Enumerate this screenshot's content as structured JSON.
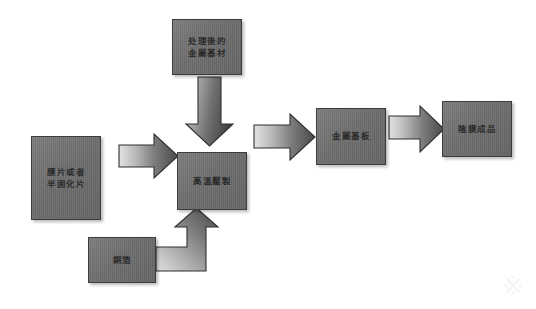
{
  "diagram": {
    "type": "process-flowchart",
    "canvas": {
      "width": 536,
      "height": 309,
      "background": "#ffffff"
    },
    "style": {
      "box_fill": "#707070",
      "box_border": "#3d3d3d",
      "arrow_fill_light": "#d8d8d8",
      "arrow_fill_dark": "#4a4a4a",
      "arrow_border": "#2f2f2f",
      "text_color": "#2b2b2b"
    },
    "nodes": [
      {
        "id": "treated-metal-substrate",
        "label": "处理後的\n金屬基材",
        "x": 172,
        "y": 19,
        "w": 70,
        "h": 56
      },
      {
        "id": "film-or-semi-cured-sheet",
        "label": "膜片或者\n半固化片",
        "x": 31,
        "y": 136,
        "w": 70,
        "h": 84
      },
      {
        "id": "high-temp-pressing",
        "label": "高溫壓製",
        "x": 177,
        "y": 152,
        "w": 70,
        "h": 58
      },
      {
        "id": "copper-foil",
        "label": "銅箔",
        "x": 88,
        "y": 237,
        "w": 68,
        "h": 46
      },
      {
        "id": "metal-base-plate",
        "label": "金屬基板",
        "x": 316,
        "y": 108,
        "w": 70,
        "h": 57
      },
      {
        "id": "finished-film-product",
        "label": "陰膜成品",
        "x": 442,
        "y": 101,
        "w": 70,
        "h": 56
      }
    ],
    "arrows": [
      {
        "id": "arrow-film-to-press",
        "from": "film-or-semi-cured-sheet",
        "to": "high-temp-pressing",
        "direction": "right"
      },
      {
        "id": "arrow-substrate-to-press",
        "from": "treated-metal-substrate",
        "to": "high-temp-pressing",
        "direction": "down"
      },
      {
        "id": "arrow-foil-to-press",
        "from": "copper-foil",
        "to": "high-temp-pressing",
        "direction": "right-then-up"
      },
      {
        "id": "arrow-press-to-plate",
        "from": "high-temp-pressing",
        "to": "metal-base-plate",
        "direction": "right"
      },
      {
        "id": "arrow-plate-to-product",
        "from": "metal-base-plate",
        "to": "finished-film-product",
        "direction": "right"
      }
    ],
    "watermark": "※"
  }
}
